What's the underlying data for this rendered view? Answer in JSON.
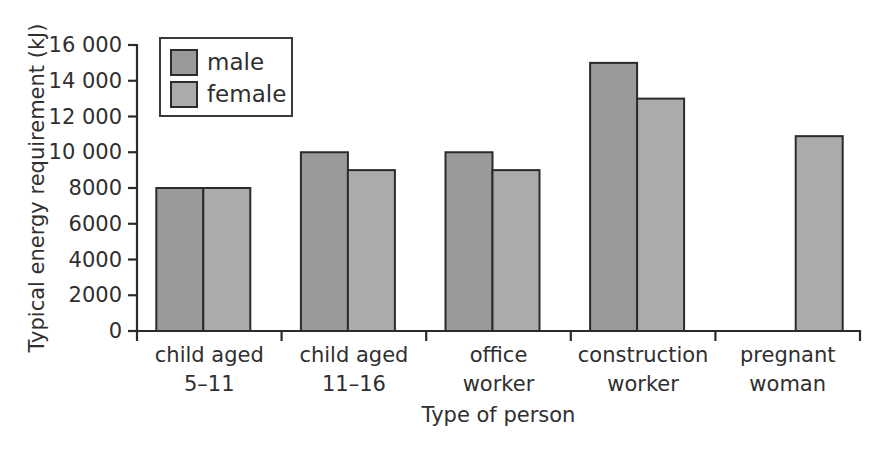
{
  "chart_data": {
    "type": "bar",
    "title": "",
    "subtitle": "",
    "xlabel": "Type of person",
    "ylabel": "Typical energy requirement (kJ)",
    "categories": [
      "child aged\n5–11",
      "child aged\n11–16",
      "office\nworker",
      "construction\nworker",
      "pregnant\nwoman"
    ],
    "category_lines": [
      [
        "child aged",
        "5–11"
      ],
      [
        "child aged",
        "11–16"
      ],
      [
        "office",
        "worker"
      ],
      [
        "construction",
        "worker"
      ],
      [
        "pregnant",
        "woman"
      ]
    ],
    "series": [
      {
        "name": "male",
        "color": "#9a9a9a",
        "values": [
          8000,
          10000,
          10000,
          15000,
          null
        ]
      },
      {
        "name": "female",
        "color": "#ababab",
        "values": [
          8000,
          9000,
          9000,
          13000,
          10900
        ]
      }
    ],
    "ylim": [
      0,
      16000
    ],
    "yticks": [
      0,
      2000,
      4000,
      6000,
      8000,
      10000,
      12000,
      14000,
      16000
    ],
    "ytick_labels": [
      "0",
      "2000",
      "4000",
      "6000",
      "8000",
      "10 000",
      "12 000",
      "14 000",
      "16 000"
    ],
    "grid": false,
    "legend": {
      "position": "top-left-inside",
      "entries": [
        {
          "label": "male",
          "color": "#9a9a9a"
        },
        {
          "label": "female",
          "color": "#ababab"
        }
      ]
    },
    "units": "kJ",
    "axis_color": "#2b2b2b",
    "background": "#ffffff"
  }
}
